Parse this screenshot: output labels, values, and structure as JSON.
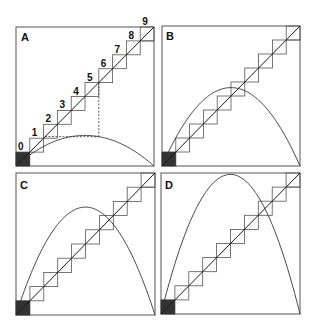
{
  "figure": {
    "colors": {
      "frame": "#555555",
      "curve": "#333333",
      "dark_box": "#333333",
      "diagonal": "#1a1a1a"
    }
  },
  "panels": [
    {
      "label": "A",
      "frame": {
        "x": 16,
        "y": 27,
        "w": 138,
        "h": 139
      },
      "curve_peak": 0.22,
      "step_labels": [
        "0",
        "1",
        "2",
        "3",
        "4",
        "5",
        "6",
        "7",
        "8",
        "9"
      ],
      "dashed_guide": {
        "step": 6,
        "curve_x": 0.22
      },
      "label_pos": {
        "x": 21,
        "y": 41
      }
    },
    {
      "label": "B",
      "frame": {
        "x": 162,
        "y": 26,
        "w": 138,
        "h": 140
      },
      "curve_peak": 0.56,
      "step_labels": [],
      "dashed_guide": null,
      "label_pos": {
        "x": 166,
        "y": 40
      }
    },
    {
      "label": "C",
      "frame": {
        "x": 16,
        "y": 173,
        "w": 139,
        "h": 142
      },
      "curve_peak": 0.76,
      "step_labels": [],
      "dashed_guide": null,
      "label_pos": {
        "x": 20,
        "y": 189
      }
    },
    {
      "label": "D",
      "frame": {
        "x": 161,
        "y": 173,
        "w": 139,
        "h": 141
      },
      "curve_peak": 0.99,
      "step_labels": [],
      "dashed_guide": null,
      "label_pos": {
        "x": 165,
        "y": 189
      }
    }
  ],
  "staircase": {
    "steps": 10,
    "filled_steps": [
      0
    ]
  }
}
